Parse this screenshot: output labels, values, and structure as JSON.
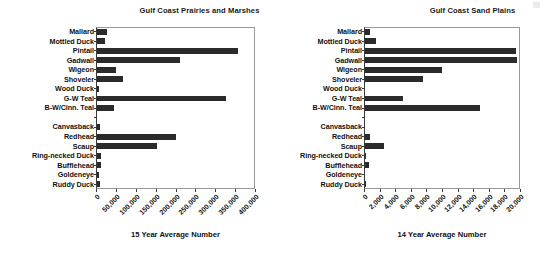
{
  "figure": {
    "background": "#ffffff",
    "bar_color": "#2b2b2b",
    "axis_color": "#3a3a3a"
  },
  "chart_data": [
    {
      "type": "bar",
      "orientation": "horizontal",
      "title": "Gulf Coast Prairies and Marshes",
      "xlabel": "15 Year Average Number",
      "ylabel": "",
      "xlim": [
        0,
        400000
      ],
      "xticks": [
        0,
        50000,
        100000,
        150000,
        200000,
        250000,
        300000,
        350000,
        400000
      ],
      "xticklabels": [
        "0",
        "50,000",
        "100,000",
        "150,000",
        "200,000",
        "250,000",
        "300,000",
        "350,000",
        "400,000"
      ],
      "grid": false,
      "legend": "none",
      "categories": [
        "Mallard",
        "Mottled Duck",
        "Pintail",
        "Gadwall",
        "Wigeon",
        "Shoveler",
        "Wood Duck",
        "G-W Teal",
        "B-W/Cinn. Teal",
        "",
        "Canvasback",
        "Redhead",
        "Scaup",
        "Ring-necked Duck",
        "Bufflehead",
        "Goldeneye",
        "Ruddy Duck"
      ],
      "values": [
        25000,
        20000,
        355000,
        210000,
        48000,
        65000,
        5000,
        325000,
        42000,
        null,
        8000,
        198000,
        150000,
        10000,
        10000,
        5000,
        8000
      ]
    },
    {
      "type": "bar",
      "orientation": "horizontal",
      "title": "Gulf Coast Sand Plains",
      "xlabel": "14 Year Average Number",
      "ylabel": "",
      "xlim": [
        0,
        20000
      ],
      "xticks": [
        0,
        2000,
        4000,
        6000,
        8000,
        10000,
        12000,
        14000,
        16000,
        18000,
        20000
      ],
      "xticklabels": [
        "0",
        "2,000",
        "4,000",
        "6,000",
        "8,000",
        "10,000",
        "12,000",
        "14,000",
        "16,000",
        "18,000",
        "20,000"
      ],
      "grid": false,
      "legend": "none",
      "categories": [
        "Mallard",
        "Mottled Duck",
        "Pintail",
        "Gadwall",
        "Wigeon",
        "Shoveler",
        "Wood Duck",
        "G-W Teal",
        "B-W/Cinn. Teal",
        "",
        "Canvasback",
        "Redhead",
        "Scaup",
        "Ring-necked Duck",
        "Bufflehead",
        "Goldeneye",
        "Ruddy Duck"
      ],
      "values": [
        600,
        1400,
        19400,
        19500,
        9900,
        7400,
        0,
        4900,
        14700,
        null,
        0,
        600,
        2400,
        150,
        550,
        0,
        150
      ]
    }
  ]
}
